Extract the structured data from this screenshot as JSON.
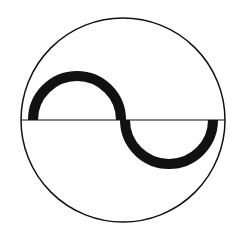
{
  "symbol": {
    "name": "AC sine wave in circle",
    "stroke_color": "#111111",
    "background": "#ffffff",
    "circle": {
      "cx": 123,
      "cy": 120,
      "r": 102,
      "stroke_width": 1.5
    },
    "axis_line": {
      "x1": 21,
      "y1": 120,
      "x2": 225,
      "y2": 120,
      "stroke_width": 1.2
    },
    "upper_arc": {
      "cx": 77,
      "cy": 120,
      "r": 44,
      "stroke_width": 10
    },
    "lower_arc": {
      "cx": 169,
      "cy": 120,
      "r": 44,
      "stroke_width": 10
    }
  }
}
